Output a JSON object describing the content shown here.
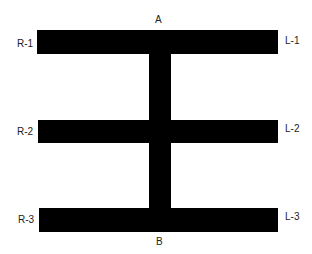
{
  "diagram": {
    "top_label": "A",
    "bottom_label": "B",
    "left_labels": [
      "R-1",
      "R-2",
      "R-3"
    ],
    "right_labels": [
      "L-1",
      "L-2",
      "L-3"
    ],
    "shape_color": "#000000",
    "background_color": "#ffffff"
  }
}
